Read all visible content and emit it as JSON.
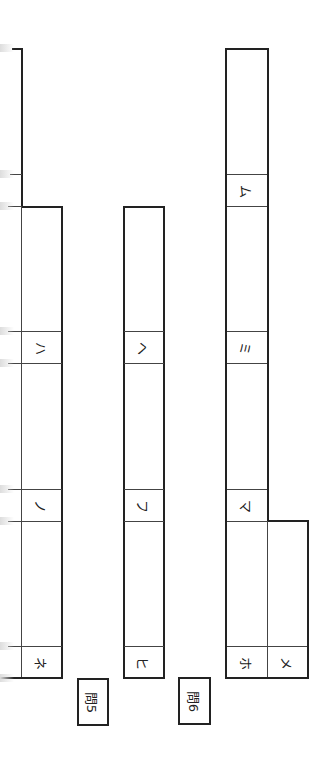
{
  "page": {
    "orientation": "rotated-90-clockwise",
    "line_color": "#222222"
  },
  "question5": {
    "label": "問5",
    "left_group": {
      "cells": [
        {
          "label": "ハ"
        },
        {
          "label": "ノ"
        },
        {
          "label": "ネ"
        }
      ]
    },
    "right_group": {
      "cells": [
        {
          "label": "ヘ"
        },
        {
          "label": "フ"
        },
        {
          "label": "ヒ"
        }
      ]
    }
  },
  "question6": {
    "label": "問6",
    "cells": [
      {
        "label": "ム"
      },
      {
        "label": "ミ"
      },
      {
        "label": "マ"
      },
      {
        "label": "ホ"
      },
      {
        "label": "メ"
      }
    ]
  }
}
